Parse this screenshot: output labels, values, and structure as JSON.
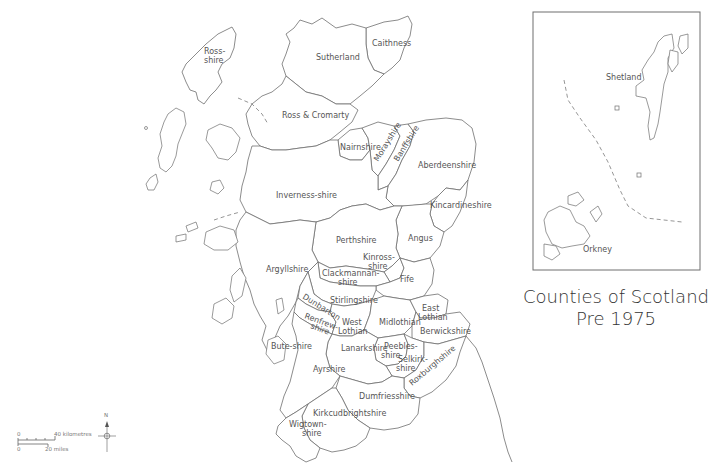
{
  "title": {
    "line1": "Counties of Scotland",
    "line2": "Pre 1975"
  },
  "inset": {
    "labels": {
      "shetland": "Shetland",
      "orkney": "Orkney"
    }
  },
  "counties": {
    "ross_shire_lewis": "Ross-",
    "ross_shire_lewis_2": "shire",
    "sutherland": "Sutherland",
    "caithness": "Caithness",
    "ross_cromarty": "Ross & Cromarty",
    "nairnshire": "Nairnshire",
    "morayshire": "Morayshire",
    "banffshire": "Banffshire",
    "aberdeenshire": "Aberdeenshire",
    "inverness_shire": "Inverness-shire",
    "kincardineshire": "Kincardineshire",
    "perthshire": "Perthshire",
    "angus": "Angus",
    "kinross_1": "Kinross-",
    "kinross_2": "shire",
    "argyllshire": "Argyllshire",
    "clackmannan_1": "Clackmannan-",
    "clackmannan_2": "shire",
    "fife": "Fife",
    "stirlingshire": "Stirlingshire",
    "dunbartonshire": "Dunbarton",
    "renfrew_1": "Renfrew-",
    "renfrew_2": "shire",
    "west_lothian_1": "West",
    "west_lothian_2": "Lothian",
    "midlothian": "Midlothian",
    "east_lothian_1": "East",
    "east_lothian_2": "Lothian",
    "berwickshire": "Berwickshire",
    "bute_shire": "Bute-shire",
    "lanarkshire": "Lanarkshire",
    "peebles_1": "Peebles-",
    "peebles_2": "shire",
    "selkirk_1": "Selkirk-",
    "selkirk_2": "shire",
    "roxburghshire": "Roxburghshire",
    "ayrshire": "Ayrshire",
    "dumfriesshire": "Dumfriesshire",
    "kirkcudbrightshire": "Kirkcudbrightshire",
    "wigtown_1": "Wigtown-",
    "wigtown_2": "shire"
  },
  "scale_bar": {
    "km_start": "0",
    "km_end": "40 kilometres",
    "mi_start": "0",
    "mi_end": "20 miles"
  },
  "north_arrow": {
    "label": "N"
  }
}
